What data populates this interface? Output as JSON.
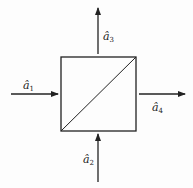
{
  "diagram": {
    "type": "beam-splitter",
    "colors": {
      "stroke": "#222222",
      "background": "#fdfdfd"
    },
    "box": {
      "x": 61,
      "y": 57,
      "size": 75
    },
    "ports": [
      {
        "id": "a1",
        "symbol": "â",
        "subscript": "1",
        "direction": "input-from-left"
      },
      {
        "id": "a2",
        "symbol": "â",
        "subscript": "2",
        "direction": "input-from-bottom"
      },
      {
        "id": "a3",
        "symbol": "â",
        "subscript": "3",
        "direction": "output-up"
      },
      {
        "id": "a4",
        "symbol": "â",
        "subscript": "4",
        "direction": "output-right"
      }
    ]
  }
}
